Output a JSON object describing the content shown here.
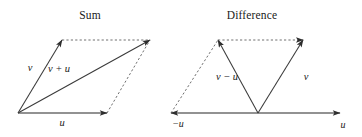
{
  "figure": {
    "width": 362,
    "height": 137,
    "background": "#ffffff",
    "stroke_solid": "#3a3a3a",
    "stroke_dashed": "#4a4a4a",
    "text_color": "#1a1a1a"
  },
  "panels": [
    {
      "id": "sum",
      "title": "Sum",
      "title_x": 90,
      "title_y": 15,
      "labels": [
        {
          "id": "v",
          "text": "v",
          "x": 30,
          "y": 67
        },
        {
          "id": "v-plus-u",
          "text": "v + u",
          "x": 59,
          "y": 68
        },
        {
          "id": "u",
          "text": "u",
          "x": 62,
          "y": 122
        }
      ],
      "solid_vectors": [
        {
          "id": "v",
          "x1": 18,
          "y1": 113,
          "x2": 62,
          "y2": 40
        },
        {
          "id": "u",
          "x1": 18,
          "y1": 113,
          "x2": 107,
          "y2": 113
        },
        {
          "id": "v-plus-u",
          "x1": 18,
          "y1": 113,
          "x2": 150,
          "y2": 40
        }
      ],
      "dashed_lines": [
        {
          "id": "top-edge",
          "x1": 62,
          "y1": 40,
          "x2": 150,
          "y2": 40
        },
        {
          "id": "right-edge",
          "x1": 107,
          "y1": 113,
          "x2": 150,
          "y2": 40
        }
      ]
    },
    {
      "id": "difference",
      "title": "Difference",
      "title_x": 252,
      "title_y": 15,
      "labels": [
        {
          "id": "v-minus-u",
          "text": "v − u",
          "x": 227,
          "y": 76
        },
        {
          "id": "v",
          "text": "v",
          "x": 306,
          "y": 76
        },
        {
          "id": "minus-u",
          "text": "−u",
          "x": 178,
          "y": 123
        },
        {
          "id": "u",
          "text": "u",
          "x": 343,
          "y": 124
        }
      ],
      "solid_vectors": [
        {
          "id": "v-minus-u",
          "x1": 258,
          "y1": 113,
          "x2": 218,
          "y2": 40
        },
        {
          "id": "v",
          "x1": 258,
          "y1": 113,
          "x2": 303,
          "y2": 40
        },
        {
          "id": "u-axis-right",
          "x1": 258,
          "y1": 113,
          "x2": 340,
          "y2": 113
        },
        {
          "id": "minus-u-axis-left",
          "x1": 258,
          "y1": 113,
          "x2": 171,
          "y2": 113
        }
      ],
      "dashed_lines": [
        {
          "id": "left-diagonal",
          "x1": 171,
          "y1": 113,
          "x2": 218,
          "y2": 40
        },
        {
          "id": "top-edge",
          "x1": 218,
          "y1": 40,
          "x2": 303,
          "y2": 40
        }
      ]
    }
  ]
}
